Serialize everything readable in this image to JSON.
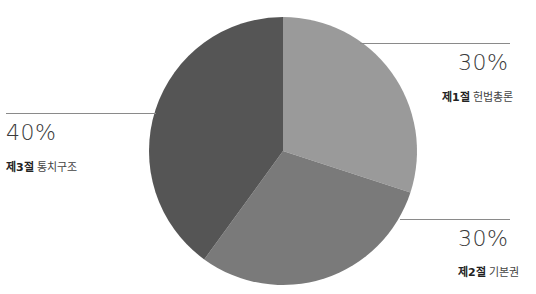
{
  "chart_data": {
    "type": "pie",
    "title": "",
    "start_angle_deg": 0,
    "direction": "clockwise",
    "slices": [
      {
        "section": "제1절",
        "name": "헌법총론",
        "value": 30,
        "label": "30%",
        "color": "#9a9a9a"
      },
      {
        "section": "제2절",
        "name": "기본권",
        "value": 30,
        "label": "30%",
        "color": "#7a7a7a"
      },
      {
        "section": "제3절",
        "name": "통치구조",
        "value": 40,
        "label": "40%",
        "color": "#555555"
      }
    ]
  },
  "labels": {
    "s1": {
      "pct": "30%",
      "section": "제1절",
      "name": "헌법총론"
    },
    "s2": {
      "pct": "30%",
      "section": "제2절",
      "name": "기본권"
    },
    "s3": {
      "pct": "40%",
      "section": "제3절",
      "name": "통치구조"
    }
  }
}
